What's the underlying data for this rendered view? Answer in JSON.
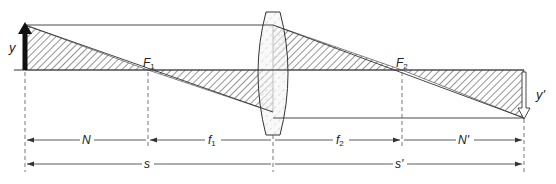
{
  "diagram": {
    "type": "thin-lens-image-formation",
    "colors": {
      "line": "#333333",
      "hatch": "#3a3a3a",
      "lens_fill": "#f4f4f4",
      "background": "#ffffff"
    },
    "labels": {
      "object_height": "y",
      "image_height": "y'",
      "focal_point_1": "F",
      "focal_point_1_sub": "1",
      "focal_point_2": "F",
      "focal_point_2_sub": "2"
    },
    "dimensions": {
      "N": "N",
      "f1_main": "f",
      "f1_sub": "1",
      "f2_main": "f",
      "f2_sub": "2",
      "N_prime": "N'",
      "s": "s",
      "s_prime": "s'"
    }
  }
}
